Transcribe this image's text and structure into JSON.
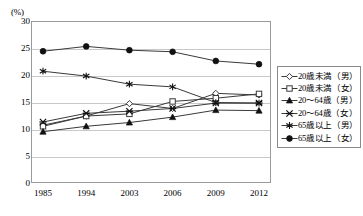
{
  "chart_data": {
    "type": "line",
    "title": "",
    "xlabel": "",
    "ylabel": "(%)",
    "ylim": [
      0,
      30
    ],
    "yticks": [
      0,
      5,
      10,
      15,
      20,
      25,
      30
    ],
    "grid": true,
    "legend_position": "right",
    "categories": [
      "1985",
      "1994",
      "2003",
      "2006",
      "2009",
      "2012"
    ],
    "series": [
      {
        "name": "20歳未満（男）",
        "marker": "open-diamond",
        "values": [
          10.7,
          12.4,
          14.7,
          13.8,
          16.6,
          16.3
        ]
      },
      {
        "name": "20歳未満（女）",
        "marker": "open-square",
        "values": [
          10.5,
          12.4,
          12.8,
          15.1,
          15.7,
          16.5
        ]
      },
      {
        "name": "20～64歳（男）",
        "marker": "filled-triangle",
        "values": [
          9.5,
          10.5,
          11.2,
          12.2,
          13.5,
          13.4
        ]
      },
      {
        "name": "20～64歳（女）",
        "marker": "cross-x",
        "values": [
          11.3,
          12.9,
          13.3,
          13.8,
          14.8,
          14.8
        ]
      },
      {
        "name": "65歳以上（男）",
        "marker": "asterisk",
        "values": [
          20.7,
          19.8,
          18.3,
          17.8,
          14.9,
          14.8
        ]
      },
      {
        "name": "65歳以上（女）",
        "marker": "filled-circle",
        "values": [
          24.4,
          25.3,
          24.6,
          24.3,
          22.6,
          22.0
        ]
      }
    ],
    "colors": {
      "line": "#3a3a3a",
      "grid": "#c9c9c9",
      "border": "#9a9a9a",
      "text": "#000000"
    }
  },
  "yticks": {
    "t0": "0",
    "t5": "5",
    "t10": "10",
    "t15": "15",
    "t20": "20",
    "t25": "25",
    "t30": "30"
  },
  "xticks": {
    "x0": "1985",
    "x1": "1994",
    "x2": "2003",
    "x3": "2006",
    "x4": "2009",
    "x5": "2012"
  },
  "axis_unit_label": "(%)",
  "legend": {
    "items": [
      {
        "label": "20歳未満（男）"
      },
      {
        "label": "20歳未満（女）"
      },
      {
        "label": "20～64歳（男）"
      },
      {
        "label": "20～64歳（女）"
      },
      {
        "label": "65歳以上（男）"
      },
      {
        "label": "65歳以上（女）"
      }
    ]
  }
}
